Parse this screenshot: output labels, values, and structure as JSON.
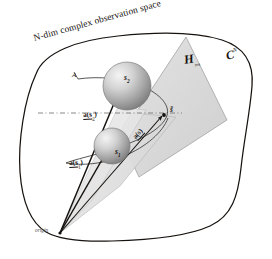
{
  "figure": {
    "type": "geometry-diagram",
    "title": "N-dim complex observation space",
    "background_color": "#ffffff",
    "ink_color": "#16120f",
    "plane_fill": "#d9d9d9",
    "cone_fill": "#e2e2e2",
    "sphere_light": "#f0f0f0",
    "sphere_dark": "#8d8d8d"
  },
  "labels": {
    "title": "N-dim complex observation space",
    "space_symbol": "C",
    "space_exponent": "N",
    "subspace_symbol": "H",
    "subspace_subscript": "res",
    "manifold": "A",
    "sphere_upper": "s",
    "sphere_upper_sub": "2",
    "sphere_lower": "s",
    "sphere_lower_sub": "1",
    "vector_upper": "a(s",
    "vector_upper_sub": "2",
    "vector_upper_close": ")",
    "vector_lower": "a(s",
    "vector_lower_sub": "1",
    "vector_lower_close": ")",
    "vector_mid": "a(s)",
    "point_tilde": "s̃",
    "origin": "origin"
  }
}
